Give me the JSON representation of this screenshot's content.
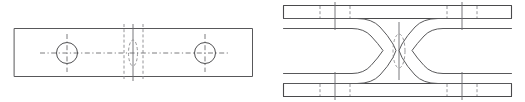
{
  "sheet": {
    "width": 525,
    "height": 102,
    "background": "#ffffff",
    "line_color": "#58585a",
    "hidden_line_color": "#8a8a8d",
    "center_line_color": "#6d6d70"
  },
  "views": [
    {
      "id": "plan-view",
      "name": "Plan View",
      "label": "",
      "plate": {
        "x": 14,
        "y": 28,
        "width": 239,
        "height": 49
      },
      "holes": [
        {
          "id": "hole-left",
          "cx": 67,
          "cy": 53,
          "r": 10.5
        },
        {
          "id": "hole-right",
          "cx": 205,
          "cy": 53,
          "r": 10.5
        }
      ],
      "horizontal_centerline": {
        "y": 53,
        "x1": 40,
        "x2": 228
      },
      "vertical_center_solid": {
        "x": 133,
        "y1": 24,
        "y2": 81
      },
      "vertical_hidden_lines": [
        {
          "x": 124,
          "y1": 24,
          "y2": 81
        },
        {
          "x": 143,
          "y1": 24,
          "y2": 81
        }
      ],
      "center_slot": {
        "cx": 133,
        "cy": 53,
        "rx": 4.5,
        "ry": 13
      }
    },
    {
      "id": "front-view",
      "name": "Front Elevation View",
      "label": "",
      "bars": [
        {
          "id": "top-bar",
          "x": 283,
          "y": 5,
          "width": 229,
          "height": 14
        },
        {
          "id": "bottom-bar",
          "x": 283,
          "y": 83,
          "width": 229,
          "height": 14
        }
      ],
      "channels": [
        {
          "id": "channel-left",
          "orientation": "opens-right"
        },
        {
          "id": "channel-right",
          "orientation": "opens-left"
        }
      ],
      "center_slot": {
        "cx": 399,
        "cy": 51,
        "rx": 6,
        "ry": 17
      },
      "center_axis": {
        "x": 399,
        "y1": 24,
        "y2": 78
      },
      "tick_lines": [
        {
          "id": "tick-top-left",
          "x": 335,
          "y1": 2,
          "y2": 30
        },
        {
          "id": "tick-top-right",
          "x": 462,
          "y1": 2,
          "y2": 30
        },
        {
          "id": "tick-bottom-left",
          "x": 335,
          "y1": 72,
          "y2": 100
        },
        {
          "id": "tick-bottom-right",
          "x": 462,
          "y1": 72,
          "y2": 100
        }
      ],
      "hidden_marks": [
        {
          "id": "hidden-top-a",
          "x": 320,
          "y1": 5,
          "y2": 19
        },
        {
          "id": "hidden-top-b",
          "x": 350,
          "y1": 5,
          "y2": 19
        },
        {
          "id": "hidden-top-c",
          "x": 447,
          "y1": 5,
          "y2": 19
        },
        {
          "id": "hidden-top-d",
          "x": 477,
          "y1": 5,
          "y2": 19
        },
        {
          "id": "hidden-bottom-a",
          "x": 320,
          "y1": 83,
          "y2": 97
        },
        {
          "id": "hidden-bottom-b",
          "x": 350,
          "y1": 83,
          "y2": 97
        },
        {
          "id": "hidden-bottom-c",
          "x": 447,
          "y1": 83,
          "y2": 97
        },
        {
          "id": "hidden-bottom-d",
          "x": 477,
          "y1": 83,
          "y2": 97
        }
      ]
    }
  ]
}
